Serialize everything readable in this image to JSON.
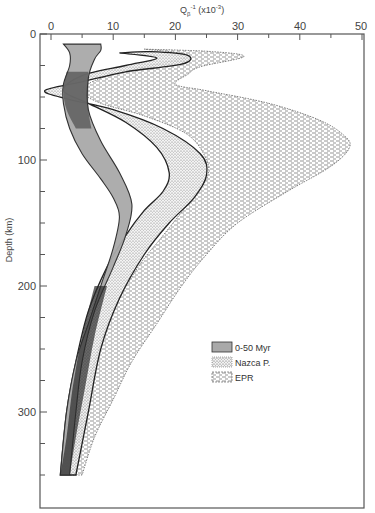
{
  "chart_data": {
    "type": "area",
    "title": "",
    "xlabel": "Q_β^-1 (x10^-3)",
    "ylabel": "Depth (km)",
    "xlim": [
      0,
      50
    ],
    "ylim": [
      0,
      375
    ],
    "y_inverted": true,
    "x_axis_position": "top",
    "grid": false,
    "x_ticks": [
      0,
      10,
      20,
      30,
      40,
      50
    ],
    "y_ticks": [
      0,
      100,
      200,
      300
    ],
    "legend_position": "lower right inside",
    "series": [
      {
        "name": "0-50 Myr",
        "pattern": "solid gray",
        "color": "#a9a9a9",
        "left_edge": [
          [
            2,
            8
          ],
          [
            3,
            15
          ],
          [
            3,
            25
          ],
          [
            2,
            40
          ],
          [
            2,
            55
          ],
          [
            3,
            75
          ],
          [
            5,
            95
          ],
          [
            8,
            115
          ],
          [
            10,
            130
          ],
          [
            11,
            145
          ],
          [
            10,
            170
          ],
          [
            8,
            200
          ],
          [
            6,
            230
          ],
          [
            4,
            260
          ],
          [
            2.5,
            300
          ],
          [
            1.5,
            350
          ]
        ],
        "right_edge": [
          [
            8,
            8
          ],
          [
            8,
            13
          ],
          [
            7,
            20
          ],
          [
            6,
            35
          ],
          [
            6,
            60
          ],
          [
            8,
            85
          ],
          [
            11,
            110
          ],
          [
            13,
            135
          ],
          [
            12,
            160
          ],
          [
            10,
            185
          ],
          [
            7,
            220
          ],
          [
            5,
            260
          ],
          [
            4,
            300
          ],
          [
            3,
            350
          ]
        ]
      },
      {
        "name": "Nazca P.",
        "pattern": "stippled dots",
        "color": "#555555",
        "outer_edge": [
          [
            11,
            15
          ],
          [
            16,
            14
          ],
          [
            22,
            17
          ],
          [
            21,
            24
          ],
          [
            12,
            30
          ],
          [
            5,
            38
          ],
          [
            -1,
            45
          ],
          [
            3,
            52
          ],
          [
            10,
            60
          ],
          [
            18,
            75
          ],
          [
            24,
            95
          ],
          [
            25,
            112
          ],
          [
            23,
            130
          ],
          [
            19,
            150
          ],
          [
            15,
            175
          ],
          [
            11,
            210
          ],
          [
            8,
            250
          ],
          [
            6,
            300
          ],
          [
            4,
            350
          ]
        ],
        "inner_edge": [
          [
            11,
            15
          ],
          [
            17,
            19
          ],
          [
            12,
            25
          ],
          [
            5,
            33
          ],
          [
            2,
            45
          ],
          [
            6,
            55
          ],
          [
            12,
            70
          ],
          [
            17,
            90
          ],
          [
            19,
            110
          ],
          [
            18,
            125
          ],
          [
            15,
            140
          ],
          [
            12,
            160
          ],
          [
            9,
            185
          ],
          [
            6,
            220
          ],
          [
            4,
            260
          ],
          [
            2.5,
            300
          ],
          [
            1.5,
            350
          ]
        ]
      },
      {
        "name": "EPR",
        "pattern": "dashed hatching",
        "color": "#444444",
        "outer_edge": [
          [
            15,
            12
          ],
          [
            26,
            14
          ],
          [
            31,
            18
          ],
          [
            24,
            26
          ],
          [
            22,
            32
          ],
          [
            20,
            40
          ],
          [
            25,
            45
          ],
          [
            35,
            55
          ],
          [
            43,
            68
          ],
          [
            47,
            80
          ],
          [
            48,
            90
          ],
          [
            45,
            105
          ],
          [
            38,
            125
          ],
          [
            30,
            150
          ],
          [
            25,
            175
          ],
          [
            21,
            200
          ],
          [
            17,
            230
          ],
          [
            13,
            260
          ],
          [
            10,
            290
          ],
          [
            7,
            320
          ],
          [
            5,
            350
          ]
        ],
        "inner_edge": [
          [
            15,
            12
          ],
          [
            22,
            17
          ],
          [
            15,
            26
          ],
          [
            8,
            35
          ],
          [
            5,
            45
          ],
          [
            8,
            55
          ],
          [
            15,
            65
          ],
          [
            22,
            80
          ],
          [
            25,
            100
          ],
          [
            25,
            115
          ],
          [
            22,
            135
          ],
          [
            18,
            160
          ],
          [
            14,
            185
          ],
          [
            10,
            220
          ],
          [
            7,
            260
          ],
          [
            5,
            300
          ],
          [
            3,
            350
          ]
        ]
      }
    ],
    "legend": [
      {
        "label": "0-50 Myr",
        "pattern": "solid gray"
      },
      {
        "label": "Nazca P.",
        "pattern": "stippled dots"
      },
      {
        "label": "EPR",
        "pattern": "dashed hatching"
      }
    ]
  },
  "axes": {
    "x_title_main": "Q",
    "x_title_sub": "β",
    "x_title_sup": "-1",
    "x_title_rest": " (x10",
    "x_title_rest_sup": "-3",
    "x_title_end": ")",
    "y_title": "Depth (km)",
    "x_tick_labels": [
      "0",
      "10",
      "20",
      "30",
      "40",
      "50"
    ],
    "y_tick_labels": [
      "0",
      "100",
      "200",
      "300"
    ]
  },
  "legend": {
    "items": [
      {
        "label": "0-50 Myr"
      },
      {
        "label": "Nazca P."
      },
      {
        "label": "EPR"
      }
    ]
  }
}
